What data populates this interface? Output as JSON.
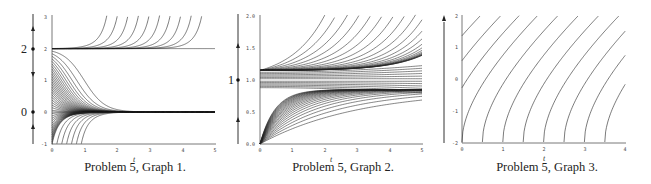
{
  "chart_data": [
    {
      "type": "line",
      "title": "Problem 5, Graph 1.",
      "xlabel": "t",
      "ylabel": "",
      "xlim": [
        0,
        5
      ],
      "ylim": [
        -1,
        3
      ],
      "x_ticks": [
        "0",
        "1",
        "2",
        "3",
        "4",
        "5"
      ],
      "y_ticks": [
        "-1",
        "0",
        "1",
        "2",
        "3"
      ],
      "phase_line": {
        "equilibria": [
          "0",
          "2"
        ],
        "arrows": "up above 2, down between 0 and 2, up below 0"
      },
      "description": "Slope field solutions: equilibrium y=0 is stable (solutions from y in (-1,2) converge to 0), y=2 is unstable (solutions above 2 grow)."
    },
    {
      "type": "line",
      "title": "Problem 5, Graph 2.",
      "xlabel": "t",
      "ylabel": "",
      "xlim": [
        0,
        5
      ],
      "ylim": [
        0.0,
        2.0
      ],
      "x_ticks": [
        "0",
        "1",
        "2",
        "3",
        "4",
        "5"
      ],
      "y_ticks": [
        "0.0",
        "0.5",
        "1.0",
        "1.5",
        "2.0"
      ],
      "phase_line": {
        "equilibria": [
          "1"
        ],
        "arrows": "up above 1, up below 1"
      },
      "description": "Solutions cluster near y≈1.15 and y≈0.85 and diverge over time; upper curves rise toward 2.0, lower curves rise from 0."
    },
    {
      "type": "line",
      "title": "Problem 5, Graph 3.",
      "xlabel": "t",
      "ylabel": "",
      "xlim": [
        0,
        4
      ],
      "ylim": [
        -2,
        2
      ],
      "x_ticks": [
        "0",
        "1",
        "2",
        "3",
        "4"
      ],
      "y_ticks": [
        "-2",
        "-1",
        "0",
        "1",
        "2"
      ],
      "phase_line": {
        "equilibria": [],
        "arrows": "up"
      },
      "description": "Family of increasing translated solution curves, starting at t = 0, 0.5, 1, ..., 3.5 on y=-2."
    }
  ],
  "captions": [
    "Problem 5, Graph 1.",
    "Problem 5, Graph 2.",
    "Problem 5, Graph 3."
  ],
  "phase_labels": {
    "g1": [
      "2",
      "0"
    ],
    "g2": [
      "1"
    ]
  },
  "axis_label": "t"
}
